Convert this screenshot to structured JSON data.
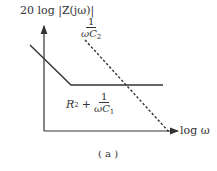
{
  "diagram": {
    "y_axis_label": "20 log |Z(jω)|",
    "x_axis_label": "log ω",
    "caption": "( a )",
    "curves": [
      {
        "name": "solid",
        "style": "solid",
        "description": "decreasing slope then flat",
        "label_prefix": "R",
        "label_prefix_sub": "2",
        "label_plus": "+",
        "label_num": "1",
        "label_den": "ωC",
        "label_den_sub": "1"
      },
      {
        "name": "dashed",
        "style": "dashed",
        "description": "decreasing straight line",
        "label_num": "1",
        "label_den": "ωC",
        "label_den_sub": "2"
      }
    ],
    "colors": {
      "line": "#333333",
      "background": "#ffffff"
    }
  }
}
